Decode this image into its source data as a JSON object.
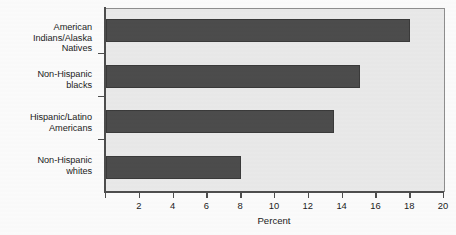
{
  "chart_data": {
    "type": "bar",
    "orientation": "horizontal",
    "title": "",
    "xlabel": "Percent",
    "ylabel": "",
    "categories": [
      "American Indians/Alaska Natives",
      "Non-Hispanic blacks",
      "Hispanic/Latino Americans",
      "Non-Hispanic whites"
    ],
    "category_lines": [
      [
        "American",
        "Indians/Alaska",
        "Natives"
      ],
      [
        "Non-Hispanic",
        "blacks"
      ],
      [
        "Hispanic/Latino",
        "Americans"
      ],
      [
        "Non-Hispanic",
        "whites"
      ]
    ],
    "values": [
      18.0,
      15.0,
      13.5,
      8.0
    ],
    "xlim": [
      0,
      20
    ],
    "xticks": [
      0,
      2,
      4,
      6,
      8,
      10,
      12,
      14,
      16,
      18,
      20
    ],
    "xticklabels": [
      "",
      "2",
      "4",
      "6",
      "8",
      "10",
      "12",
      "14",
      "16",
      "18",
      "20"
    ],
    "grid": false,
    "legend": "none",
    "colors": {
      "bar_fill": "#4c4c4c",
      "bar_edge": "#3a3a3a",
      "plot_background": "#e9e9e9",
      "figure_background": "#fbfbfb",
      "axis": "#4d4d4d",
      "text": "#1b1b1b"
    }
  }
}
